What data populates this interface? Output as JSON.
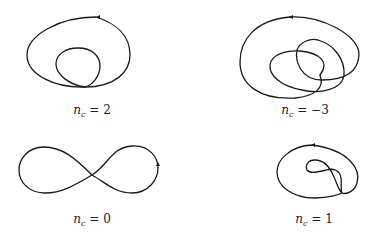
{
  "panels": [
    {
      "id": "nc-2",
      "variable": "n",
      "subscript": "c",
      "relation": " = ",
      "value": "2",
      "description": "Closed curve with one interior loop"
    },
    {
      "id": "nc-minus3",
      "variable": "n",
      "subscript": "c",
      "relation": " = ",
      "value": "−3",
      "description": "Closed curve with two overlapping interior loops"
    },
    {
      "id": "nc-0",
      "variable": "n",
      "subscript": "c",
      "relation": " = ",
      "value": "0",
      "description": "Figure-eight curve"
    },
    {
      "id": "nc-1",
      "variable": "n",
      "subscript": "c",
      "relation": " = ",
      "value": "1",
      "description": "Closed curve with small twisted interior loop"
    }
  ],
  "colors": {
    "stroke": "#1a1a1a",
    "background": "#ffffff",
    "text": "#222222"
  }
}
